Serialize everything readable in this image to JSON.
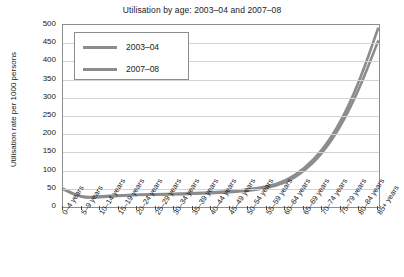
{
  "chart_data": {
    "type": "line",
    "title": "Utilisation by age: 2003–04 and 2007–08",
    "xlabel": "",
    "ylabel": "Utilisation rate per 1000 persons",
    "ylim": [
      0,
      500
    ],
    "yticks": [
      0,
      50,
      100,
      150,
      200,
      250,
      300,
      350,
      400,
      450,
      500
    ],
    "grid": true,
    "legend_position": "upper left",
    "categories": [
      "0–4 years",
      "5–9 years",
      "10–14 years",
      "15–19 years",
      "20–24 years",
      "25–29 years",
      "30–34 years",
      "35–39 years",
      "40–44 years",
      "45–49 years",
      "50–54 years",
      "55–59 years",
      "60–64 years",
      "65–69 years",
      "70–74 years",
      "75–79 years",
      "80–84 years",
      "85+ years"
    ],
    "series": [
      {
        "name": "2003–04",
        "color": "#8c8c8c",
        "values": [
          49,
          25,
          27,
          31,
          33,
          34,
          35,
          36,
          38,
          41,
          45,
          52,
          66,
          97,
          147,
          222,
          325,
          455
        ]
      },
      {
        "name": "2007–08",
        "color": "#8c8c8c",
        "values": [
          50,
          26,
          29,
          32,
          34,
          35,
          36,
          38,
          40,
          43,
          48,
          56,
          71,
          104,
          156,
          234,
          345,
          490
        ]
      }
    ]
  },
  "legend": {
    "entries": [
      {
        "label": "2003–04"
      },
      {
        "label": "2007–08"
      }
    ]
  },
  "colors": {
    "series_line": "#8c8c8c",
    "grid": "#d2d2d2",
    "axis": "#8d8d8d",
    "text": "#1a1a1a",
    "background": "#ffffff"
  }
}
